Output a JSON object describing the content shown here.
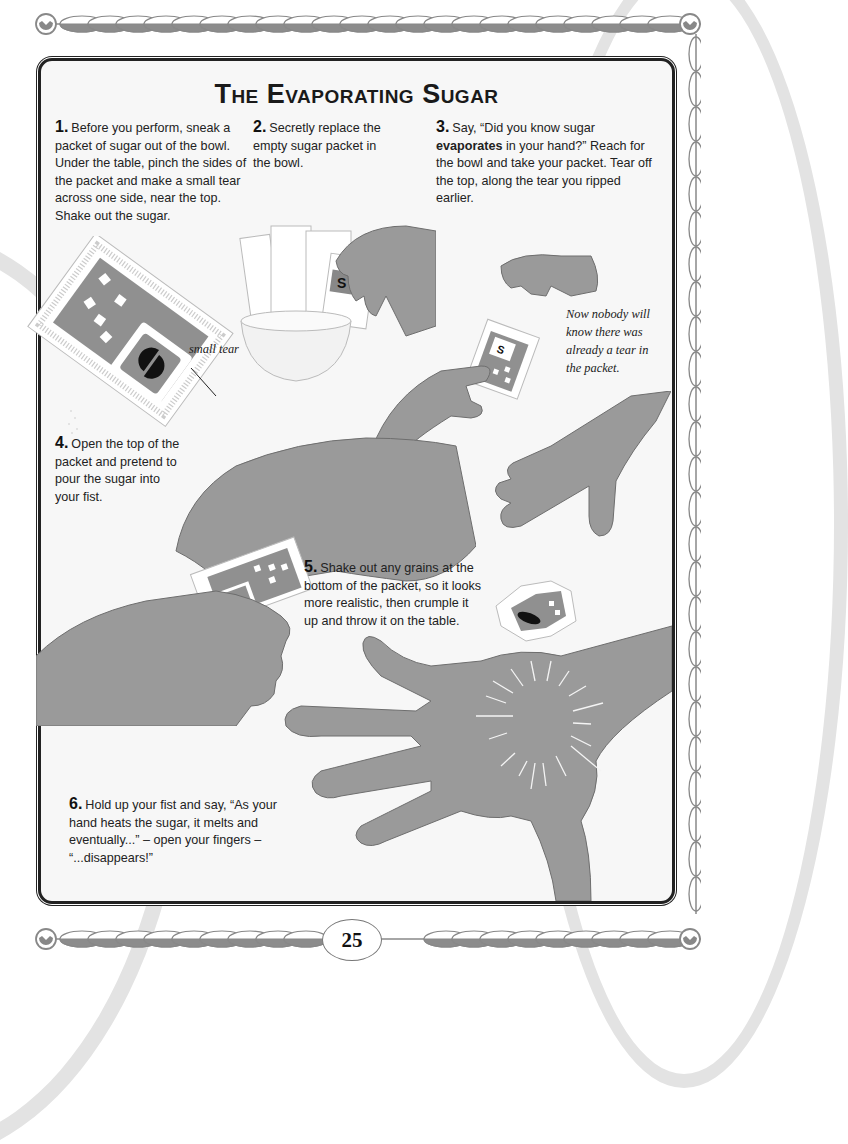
{
  "page": {
    "title": "The Evaporating Sugar",
    "page_number": "25"
  },
  "steps": [
    {
      "number": "1.",
      "text": "Before you perform, sneak a packet of sugar out of the bowl. Under the table, pinch the sides of the packet and make a small tear across one side, near the top. Shake out the sugar."
    },
    {
      "number": "2.",
      "text": "Secretly replace the empty sugar packet in the bowl."
    },
    {
      "number": "3.",
      "text_before": "Say, “Did you know sugar ",
      "bold": "evaporates",
      "text_after": " in your hand?” Reach for the bowl and take your packet. Tear off the top, along the tear you ripped earlier."
    },
    {
      "number": "4.",
      "text": "Open the top of the packet and pretend to pour the sugar into your fist."
    },
    {
      "number": "5.",
      "text": "Shake out any grains at the bottom of the packet, so it looks more realistic, then crumple it up and throw it on the table."
    },
    {
      "number": "6.",
      "text": "Hold up your fist and say, “As your hand heats the sugar, it melts and eventually...” – open your fingers – “...disappears!”"
    }
  ],
  "annotations": {
    "small_tear_label": "small tear",
    "note": "Now nobody will know there was already a tear in the packet."
  },
  "packet": {
    "logo_letter": "S"
  },
  "colors": {
    "hand": "#9a9a9a",
    "hand_outline": "#6e6e6e",
    "panel_bg": "#f7f7f7",
    "frame": "#222222",
    "bead": "#8c8c8c"
  }
}
